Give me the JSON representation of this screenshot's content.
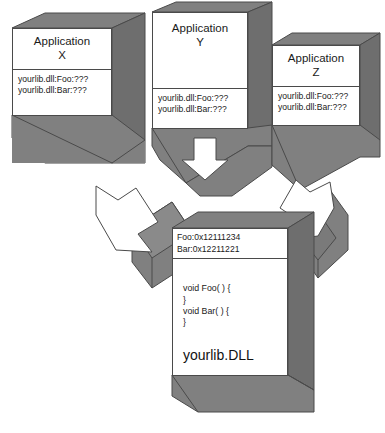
{
  "diagram": {
    "colors": {
      "block_face": "#808080",
      "block_face_dark": "#6e6e6e",
      "outline": "#4a4a4a",
      "panel_background": "#ffffff",
      "arrow_fill": "#ffffff",
      "text": "#1a1a1a"
    }
  },
  "applications": [
    {
      "id": "x",
      "title": "Application\nX",
      "imports": "yourlib.dll:Foo:???\nyourlib.dll:Bar:???"
    },
    {
      "id": "y",
      "title": "Application\nY",
      "imports": "yourlib.dll:Foo:???\nyourlib.dll:Bar:???"
    },
    {
      "id": "z",
      "title": "Application\nZ",
      "imports": "yourlib.dll:Foo:???\nyourlib.dll:Bar:???"
    }
  ],
  "library": {
    "addresses": "Foo:0x12111234\nBar:0x12211221",
    "code": "void Foo( ) {\n}\nvoid Bar( ) {\n}",
    "name": "yourlib.DLL"
  },
  "arrows": [
    {
      "id": "arrow-x-to-dll",
      "direction": "down-right",
      "label": ""
    },
    {
      "id": "arrow-y-to-dll",
      "direction": "down",
      "label": ""
    },
    {
      "id": "arrow-z-to-dll",
      "direction": "down-left",
      "label": ""
    }
  ]
}
